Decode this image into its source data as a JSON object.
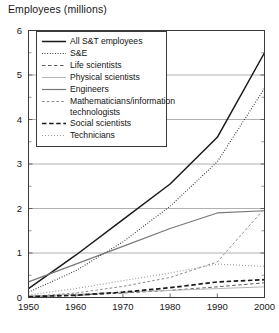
{
  "chart_data": {
    "type": "line",
    "title": "Employees (millions)",
    "xlabel": "",
    "ylabel": "Employees (millions)",
    "x": [
      1950,
      1960,
      1970,
      1980,
      1990,
      2000
    ],
    "xlim": [
      1950,
      2000
    ],
    "ylim": [
      0,
      6
    ],
    "yticks": [
      0,
      1,
      2,
      3,
      4,
      5,
      6
    ],
    "ytick_labels": [
      "0",
      "1",
      "2",
      "3",
      "4",
      "5",
      "6"
    ],
    "xticks": [
      1950,
      1960,
      1970,
      1980,
      1990,
      2000
    ],
    "xtick_labels": [
      "1950",
      "1960",
      "1970",
      "1980",
      "1990",
      "2000"
    ],
    "grid": "horizontal",
    "legend_position": "upper-left",
    "series": [
      {
        "name": "All S&T employees",
        "style": "solid",
        "color": "#1a1a1a",
        "width": 1.5,
        "values": [
          0.2,
          0.95,
          1.75,
          2.55,
          3.6,
          5.5
        ]
      },
      {
        "name": "S&E",
        "style": "dotted-fine",
        "color": "#2b2b2b",
        "width": 1.1,
        "values": [
          0.12,
          0.6,
          1.25,
          2.05,
          3.05,
          4.7
        ]
      },
      {
        "name": "Life scientists",
        "style": "dashed",
        "color": "#5a5a5a",
        "width": 1,
        "values": [
          0.02,
          0.05,
          0.1,
          0.16,
          0.24,
          0.33
        ]
      },
      {
        "name": "Physical scientists",
        "style": "solid",
        "color": "#b5b5b5",
        "width": 1,
        "values": [
          0.03,
          0.07,
          0.12,
          0.16,
          0.2,
          0.24
        ]
      },
      {
        "name": "Engineers",
        "style": "solid",
        "color": "#787878",
        "width": 1.2,
        "values": [
          0.35,
          0.75,
          1.15,
          1.55,
          1.9,
          1.95
        ]
      },
      {
        "name": "Mathematicians/information\ntechnologists",
        "style": "dashed-fine",
        "color": "#8a8a8a",
        "width": 1,
        "values": [
          0.02,
          0.1,
          0.25,
          0.45,
          0.8,
          2.0
        ]
      },
      {
        "name": "Social scientists",
        "style": "dashed-bold",
        "color": "#1a1a1a",
        "width": 1.7,
        "values": [
          0.02,
          0.05,
          0.12,
          0.22,
          0.35,
          0.4
        ]
      },
      {
        "name": "Technicians",
        "style": "dotted",
        "color": "#9a9a9a",
        "width": 1.1,
        "values": [
          0.06,
          0.2,
          0.38,
          0.55,
          0.75,
          0.7
        ]
      }
    ]
  }
}
